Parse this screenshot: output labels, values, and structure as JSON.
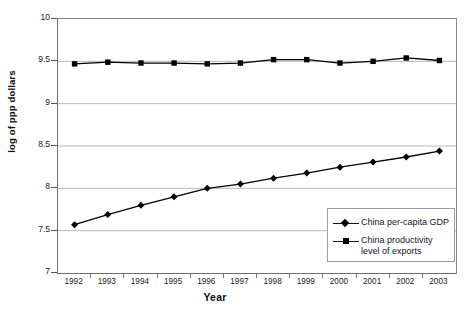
{
  "chart_data": {
    "type": "line",
    "title": "",
    "xlabel": "Year",
    "ylabel": "log of ppp dollars",
    "x": [
      1992,
      1993,
      1994,
      1995,
      1996,
      1997,
      1998,
      1999,
      2000,
      2001,
      2002,
      2003
    ],
    "xticklabels": [
      "1992",
      "1993",
      "1994",
      "1995",
      "1996",
      "1997",
      "1998",
      "1999",
      "2000",
      "2001",
      "2002",
      "2003"
    ],
    "yticklabels": [
      "7",
      "7.5",
      "8",
      "8.5",
      "9",
      "9.5",
      "10"
    ],
    "yticks": [
      7,
      7.5,
      8,
      8.5,
      9,
      9.5,
      10
    ],
    "ylim": [
      7,
      10
    ],
    "grid": "horizontal",
    "legend_position": "lower-right-inside",
    "series": [
      {
        "name": "China per-capita GDP",
        "marker": "diamond",
        "color": "#000000",
        "values": [
          7.57,
          7.69,
          7.8,
          7.9,
          8.0,
          8.05,
          8.12,
          8.18,
          8.25,
          8.31,
          8.37,
          8.44
        ]
      },
      {
        "name": "China productivity level of exports",
        "marker": "square",
        "color": "#000000",
        "values": [
          9.47,
          9.49,
          9.48,
          9.48,
          9.47,
          9.48,
          9.52,
          9.52,
          9.48,
          9.5,
          9.54,
          9.51
        ]
      }
    ]
  },
  "legend": {
    "entries": [
      {
        "label": "China per-capita GDP",
        "marker": "diamond"
      },
      {
        "label": "China productivity level of exports",
        "marker": "square"
      }
    ]
  },
  "title_remnant": "",
  "colors": {
    "axis": "#6e6e6e",
    "gridline": "#b9b9b9",
    "series": "#000000",
    "legend_border": "#9a9aa8",
    "background": "#ffffff"
  }
}
